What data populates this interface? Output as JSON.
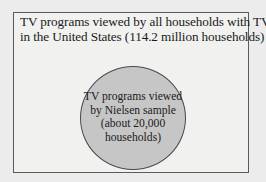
{
  "diagram": {
    "type": "venn-subset",
    "colors": {
      "background": "#ececec",
      "outer_box_fill": "#f1f1f0",
      "outer_box_border": "#5a5a5a",
      "circle_fill": "#c6c6c6",
      "circle_border": "#4a4a4a",
      "text": "#1a1a1a"
    },
    "population": {
      "label_lines": [
        "TV programs viewed by all households with TVs",
        "in the United States (114.2 million households)"
      ]
    },
    "sample": {
      "label_lines": [
        "TV programs viewed",
        "by Nielsen sample",
        "(about 20,000",
        "households)"
      ]
    }
  }
}
